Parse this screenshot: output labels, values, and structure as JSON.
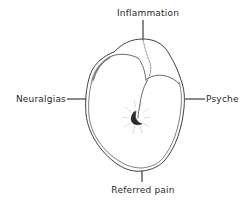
{
  "diagram": {
    "type": "tooth-pain-sources",
    "labels": {
      "top": "Inflammation",
      "left": "Neuralgias",
      "right": "Psyche",
      "bottom": "Referred pain"
    },
    "colors": {
      "ink": "#2a2a2a",
      "background": "#ffffff"
    }
  }
}
